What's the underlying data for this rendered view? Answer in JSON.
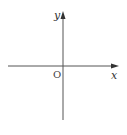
{
  "diagram": {
    "type": "coordinate-axes",
    "labels": {
      "x_axis": "x",
      "y_axis": "y",
      "origin": "O"
    },
    "colors": {
      "axis": "#555555",
      "text": "#333333"
    }
  }
}
